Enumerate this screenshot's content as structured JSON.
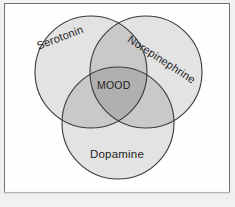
{
  "figure": {
    "type": "venn-diagram-3-set",
    "title": "",
    "background_color": "#f1f1f0",
    "panel_color": "#fefefe",
    "frame_border_color": "#6f7174"
  },
  "palette": {
    "single_fill": "#e3e3e3",
    "double_overlap_fill": "#c9c9c9",
    "triple_overlap_fill": "#b0b0b0",
    "circle_stroke": "#3a3a3a",
    "label_color": "#1d1d1d"
  },
  "sets": [
    {
      "id": "serotonin",
      "label": "Serotonin",
      "position": "top-left",
      "center": [
        90,
        70
      ],
      "radius": 56,
      "label_rotation_deg": -21
    },
    {
      "id": "norepinephrine",
      "label": "Norepinephrine",
      "position": "top-right",
      "center": [
        145,
        70
      ],
      "radius": 56,
      "label_rotation_deg": 33
    },
    {
      "id": "dopamine",
      "label": "Dopamine",
      "position": "bottom-center",
      "center": [
        117,
        121
      ],
      "radius": 56,
      "label_rotation_deg": 0
    }
  ],
  "intersection": {
    "id": "mood",
    "label": "MOOD",
    "description": "central region where all three sets overlap",
    "label_rotation_deg": 0
  }
}
